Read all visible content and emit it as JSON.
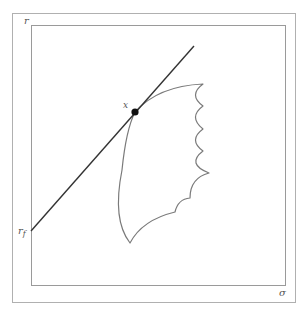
{
  "diagram": {
    "axis_labels": {
      "vertical": "r",
      "horizontal": "σ",
      "intercept_main": "r",
      "intercept_sub": "f"
    },
    "point_label": "x",
    "colors": {
      "frame": "#9a9a9a",
      "line": "#333333",
      "curve": "#7a7a7a",
      "point": "#111111",
      "text": "#555555",
      "background": "#ffffff"
    },
    "elements": [
      "outer frame",
      "inner plot frame",
      "straight line from r_f tangent at point x",
      "scalloped feasible region bounded by arcs",
      "tangency point x"
    ]
  }
}
